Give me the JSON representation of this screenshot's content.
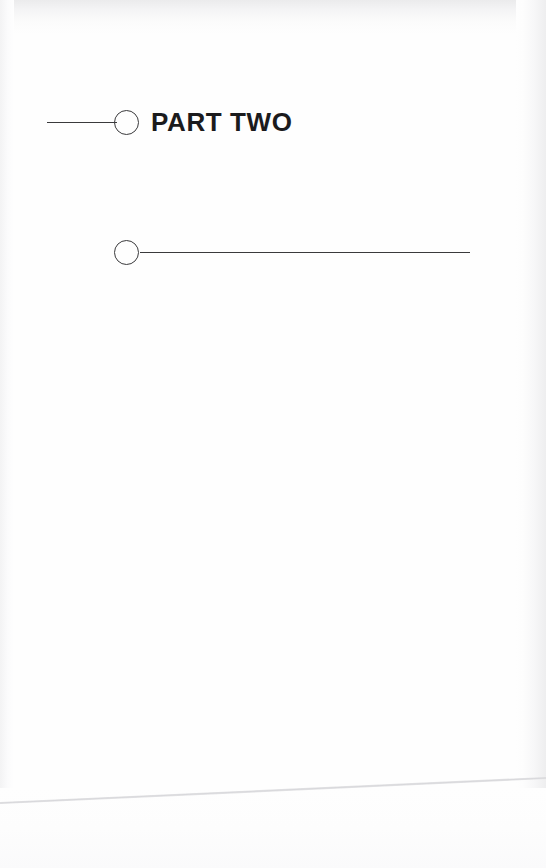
{
  "page": {
    "kind": "book-part-divider-page",
    "width": 546,
    "height": 868,
    "background_color": "#ffffff",
    "ink_color": "#3a3a3c",
    "text_color": "#1b1b1d",
    "edge_shadow_color": "#ebebec"
  },
  "divider_top": {
    "label": "PART TWO",
    "rule_before": {
      "x_start": 47,
      "x_end": 115,
      "thickness": 1
    },
    "circle": {
      "center_x": 127,
      "center_y": 123,
      "diameter": 25,
      "filled": false
    },
    "baseline_y": 123
  },
  "divider_bottom": {
    "label": "",
    "circle": {
      "center_x": 127,
      "center_y": 253,
      "diameter": 25,
      "filled": false
    },
    "rule_after": {
      "x_start": 140,
      "x_end": 470,
      "thickness": 1
    },
    "baseline_y": 253
  },
  "sheet_edge": {
    "left_y": 803,
    "right_y": 778,
    "color": "#e3e3e5"
  }
}
